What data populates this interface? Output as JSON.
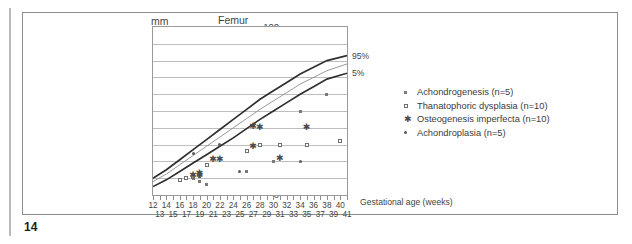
{
  "page": {
    "page_number": "14"
  },
  "chart_data": {
    "type": "scatter",
    "title": "Femur",
    "xlabel": "Gestational age (weeks)",
    "ylabel": "mm",
    "ylim": [
      0,
      100
    ],
    "xlim": [
      12,
      41
    ],
    "ytick_step": 10,
    "yticks": [
      "0",
      "10",
      "20",
      "30",
      "40",
      "50",
      "60",
      "70",
      "80",
      "90",
      "100"
    ],
    "xticks_row1": [
      "12",
      "14",
      "16",
      "18",
      "20",
      "22",
      "24",
      "26",
      "28",
      "30",
      "32",
      "34",
      "36",
      "38",
      "40"
    ],
    "xticks_row2": [
      "13",
      "15",
      "17",
      "19",
      "21",
      "23",
      "25",
      "27",
      "29",
      "31",
      "33",
      "35",
      "37",
      "39",
      "41"
    ],
    "grid": true,
    "legend_position": "right-outside",
    "reference_curves": [
      {
        "name": "95%",
        "label": "95%",
        "style": "thick",
        "points": [
          [
            12,
            10
          ],
          [
            14,
            15
          ],
          [
            16,
            21
          ],
          [
            18,
            27
          ],
          [
            20,
            33
          ],
          [
            22,
            39
          ],
          [
            24,
            45
          ],
          [
            26,
            51
          ],
          [
            28,
            57
          ],
          [
            30,
            62
          ],
          [
            32,
            67
          ],
          [
            34,
            72
          ],
          [
            36,
            76
          ],
          [
            38,
            80
          ],
          [
            41,
            83
          ]
        ]
      },
      {
        "name": "50%",
        "label": "",
        "style": "thin",
        "points": [
          [
            12,
            8
          ],
          [
            14,
            12.5
          ],
          [
            16,
            18
          ],
          [
            18,
            23.5
          ],
          [
            20,
            29
          ],
          [
            22,
            34.5
          ],
          [
            24,
            40
          ],
          [
            26,
            45.5
          ],
          [
            28,
            51
          ],
          [
            30,
            56
          ],
          [
            32,
            61
          ],
          [
            34,
            66
          ],
          [
            36,
            70
          ],
          [
            38,
            74
          ],
          [
            41,
            78
          ]
        ]
      },
      {
        "name": "5%",
        "label": "5%",
        "style": "thick",
        "points": [
          [
            12,
            5
          ],
          [
            14,
            9
          ],
          [
            16,
            14
          ],
          [
            18,
            19
          ],
          [
            20,
            24
          ],
          [
            22,
            29
          ],
          [
            24,
            34
          ],
          [
            26,
            39.5
          ],
          [
            28,
            45
          ],
          [
            30,
            50
          ],
          [
            32,
            55
          ],
          [
            34,
            60
          ],
          [
            36,
            64.5
          ],
          [
            38,
            69
          ],
          [
            41,
            72.5
          ]
        ]
      }
    ],
    "series": [
      {
        "name": "Achondrogenesis (n=5)",
        "marker": "filled-square",
        "n": 5,
        "points": [
          [
            17,
            10
          ],
          [
            18,
            10
          ],
          [
            19,
            11
          ],
          [
            19,
            8
          ],
          [
            20,
            6
          ]
        ]
      },
      {
        "name": "Thanatophoric dysplasia (n=10)",
        "marker": "open-square",
        "n": 10,
        "points": [
          [
            16,
            9
          ],
          [
            17,
            10
          ],
          [
            18,
            11
          ],
          [
            20,
            18
          ],
          [
            26,
            26
          ],
          [
            28,
            30
          ],
          [
            31,
            30
          ],
          [
            35,
            30
          ],
          [
            40,
            32
          ],
          [
            18,
            11
          ]
        ]
      },
      {
        "name": "Osteogenesis imperfecta (n=10)",
        "marker": "asterisk",
        "n": 10,
        "points": [
          [
            18,
            11
          ],
          [
            19,
            11
          ],
          [
            19,
            12
          ],
          [
            21,
            20
          ],
          [
            22,
            20
          ],
          [
            27,
            40
          ],
          [
            28,
            39
          ],
          [
            27,
            28
          ],
          [
            31,
            21
          ],
          [
            35,
            39
          ]
        ]
      },
      {
        "name": "Achondroplasia (n=5)",
        "marker": "filled-dot",
        "n": 5,
        "points": [
          [
            18,
            25
          ],
          [
            22,
            30
          ],
          [
            25,
            14
          ],
          [
            30,
            20
          ],
          [
            34,
            20
          ]
        ]
      }
    ],
    "scatter_extra_points": [
      [
        34,
        50
      ],
      [
        38,
        60
      ],
      [
        30,
        20
      ],
      [
        26,
        14
      ]
    ]
  },
  "legend": {
    "items": [
      {
        "label": "Achondrogenesis (n=5)",
        "marker": "filled-square"
      },
      {
        "label": "Thanatophoric dysplasia (n=10)",
        "marker": "open-square"
      },
      {
        "label": "Osteogenesis imperfecta (n=10)",
        "marker": "asterisk"
      },
      {
        "label": "Achondroplasia (n=5)",
        "marker": "filled-dot"
      }
    ]
  }
}
